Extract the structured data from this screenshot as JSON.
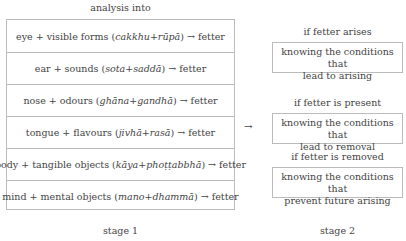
{
  "stage1": {
    "heading": "analysis into",
    "footer": "stage 1",
    "rows": [
      {
        "pre": "eye + visible forms (",
        "pali1": "cakkhu",
        "plus": " + ",
        "pali2": "rūpā",
        "post": ")  → fetter"
      },
      {
        "pre": "ear + sounds (",
        "pali1": "sota",
        "plus": " + ",
        "pali2": "saddā",
        "post": ")  → fetter"
      },
      {
        "pre": "nose + odours (",
        "pali1": "ghāna",
        "plus": " + ",
        "pali2": "gandhā",
        "post": ")  → fetter"
      },
      {
        "pre": "tongue + flavours (",
        "pali1": "jivhā",
        "plus": " + ",
        "pali2": "rasā",
        "post": ")  → fetter"
      },
      {
        "pre": "body + tangible objects (",
        "pali1": "kāya",
        "plus": " + ",
        "pali2": "phoṭṭabbhā",
        "post": ")  → fetter"
      },
      {
        "pre": "mind + mental objects (",
        "pali1": "mano",
        "plus": " + ",
        "pali2": "dhammā",
        "post": ")  → fetter"
      }
    ]
  },
  "connector": {
    "arrow": "→"
  },
  "stage2": {
    "footer": "stage 2",
    "items": [
      {
        "condition": "if fetter arises",
        "line1": "knowing the conditions that",
        "line2": "lead to arising"
      },
      {
        "condition": "if fetter is present",
        "line1": "knowing the conditions that",
        "line2": "lead to removal"
      },
      {
        "condition": "if fetter is removed",
        "line1": "knowing the conditions that",
        "line2": "prevent future arising"
      }
    ]
  }
}
